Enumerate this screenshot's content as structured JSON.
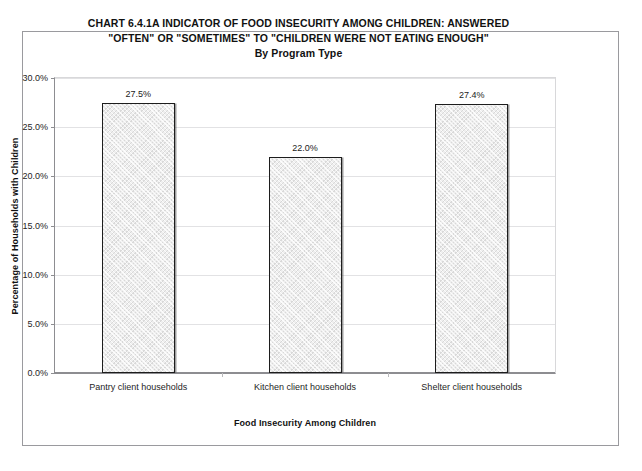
{
  "chart_data": {
    "type": "bar",
    "title": "CHART 6.4.1A    INDICATOR OF FOOD INSECURITY AMONG CHILDREN:  ANSWERED \"OFTEN\" OR \"SOMETIMES\" TO \"CHILDREN WERE NOT EATING ENOUGH\" By Program Type",
    "title_lines": [
      "CHART 6.4.1A    INDICATOR OF FOOD INSECURITY AMONG CHILDREN:  ANSWERED",
      "\"OFTEN\" OR \"SOMETIMES\" TO \"CHILDREN WERE NOT EATING ENOUGH\"",
      "By Program Type"
    ],
    "xlabel": "Food Insecurity Among Children",
    "ylabel": "Percentage of Households with Children",
    "categories": [
      "Pantry client households",
      "Kitchen client households",
      "Shelter client households"
    ],
    "values": [
      27.5,
      22.0,
      27.4
    ],
    "data_labels": [
      "27.5%",
      "22.0%",
      "27.4%"
    ],
    "ylim": [
      0,
      30
    ],
    "ytick_values": [
      0,
      5,
      10,
      15,
      20,
      25,
      30
    ],
    "ytick_labels": [
      "0.0%",
      "5.0%",
      "10.0%",
      "15.0%",
      "20.0%",
      "25.0%",
      "30.0%"
    ],
    "grid": true,
    "legend": "none",
    "colors": {
      "bar_fill": "#eeeeee",
      "bar_border": "#1d1d1d",
      "gridline": "#e2e2e4",
      "axis": "#8d8d91",
      "frame": "#9a9a9e",
      "text": "#1a1a1a",
      "background": "#ffffff"
    }
  }
}
